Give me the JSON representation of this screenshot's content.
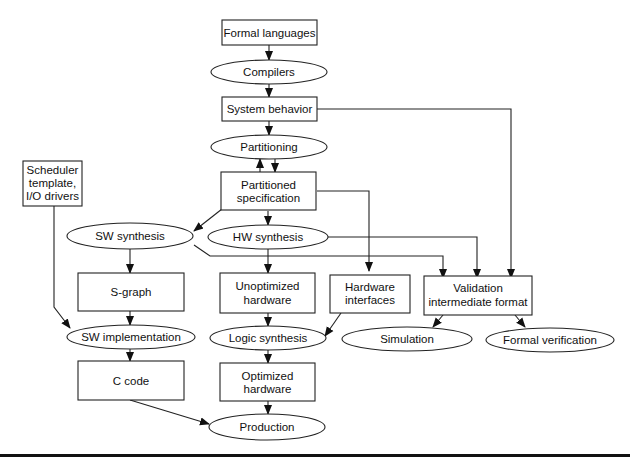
{
  "diagram": {
    "nodes": {
      "formal_languages": {
        "shape": "rect",
        "lines": [
          "Formal languages"
        ]
      },
      "compilers": {
        "shape": "ellipse",
        "lines": [
          "Compilers"
        ]
      },
      "system_behavior": {
        "shape": "rect",
        "lines": [
          "System behavior"
        ]
      },
      "partitioning": {
        "shape": "ellipse",
        "lines": [
          "Partitioning"
        ]
      },
      "partitioned_specification": {
        "shape": "rect",
        "lines": [
          "Partitioned",
          "specification"
        ]
      },
      "scheduler_template": {
        "shape": "rect",
        "lines": [
          "Scheduler",
          "template,",
          "I/O drivers"
        ]
      },
      "sw_synthesis": {
        "shape": "ellipse",
        "lines": [
          "SW synthesis"
        ]
      },
      "hw_synthesis": {
        "shape": "ellipse",
        "lines": [
          "HW synthesis"
        ]
      },
      "s_graph": {
        "shape": "rect",
        "lines": [
          "S-graph"
        ]
      },
      "unoptimized_hardware": {
        "shape": "rect",
        "lines": [
          "Unoptimized",
          "hardware"
        ]
      },
      "hardware_interfaces": {
        "shape": "rect",
        "lines": [
          "Hardware",
          "interfaces"
        ]
      },
      "validation_format": {
        "shape": "rect",
        "lines": [
          "Validation",
          "intermediate format"
        ]
      },
      "sw_implementation": {
        "shape": "ellipse",
        "lines": [
          "SW implementation"
        ]
      },
      "logic_synthesis": {
        "shape": "ellipse",
        "lines": [
          "Logic synthesis"
        ]
      },
      "simulation": {
        "shape": "ellipse",
        "lines": [
          "Simulation"
        ]
      },
      "formal_verification": {
        "shape": "ellipse",
        "lines": [
          "Formal verification"
        ]
      },
      "c_code": {
        "shape": "rect",
        "lines": [
          "C code"
        ]
      },
      "optimized_hardware": {
        "shape": "rect",
        "lines": [
          "Optimized",
          "hardware"
        ]
      },
      "production": {
        "shape": "ellipse",
        "lines": [
          "Production"
        ]
      }
    },
    "edges": [
      [
        "formal_languages",
        "compilers"
      ],
      [
        "compilers",
        "system_behavior"
      ],
      [
        "system_behavior",
        "partitioning"
      ],
      [
        "system_behavior",
        "validation_format"
      ],
      [
        "partitioning",
        "partitioned_specification"
      ],
      [
        "partitioned_specification",
        "partitioning"
      ],
      [
        "partitioned_specification",
        "sw_synthesis"
      ],
      [
        "partitioned_specification",
        "hw_synthesis"
      ],
      [
        "partitioned_specification",
        "hardware_interfaces"
      ],
      [
        "sw_synthesis",
        "s_graph"
      ],
      [
        "sw_synthesis",
        "validation_format"
      ],
      [
        "hw_synthesis",
        "unoptimized_hardware"
      ],
      [
        "hw_synthesis",
        "validation_format"
      ],
      [
        "scheduler_template",
        "sw_implementation"
      ],
      [
        "s_graph",
        "sw_implementation"
      ],
      [
        "unoptimized_hardware",
        "logic_synthesis"
      ],
      [
        "hardware_interfaces",
        "logic_synthesis"
      ],
      [
        "validation_format",
        "simulation"
      ],
      [
        "validation_format",
        "formal_verification"
      ],
      [
        "sw_implementation",
        "c_code"
      ],
      [
        "logic_synthesis",
        "optimized_hardware"
      ],
      [
        "c_code",
        "production"
      ],
      [
        "optimized_hardware",
        "production"
      ]
    ]
  }
}
